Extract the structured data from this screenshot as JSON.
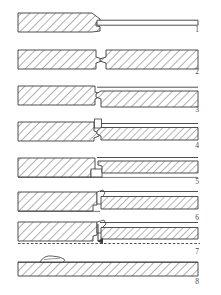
{
  "figure": {
    "background_color": "#ffffff",
    "line_color": "#3b3b3b",
    "hatch_color": "#6e6e6e",
    "label_color": "#4a4a4a",
    "step_count": 8
  },
  "steps": [
    {
      "number": "1",
      "label_x": 197,
      "label_y": 30,
      "caption": "Tapered hatched block at left with thin flat strip extending to the right",
      "parts": [
        {
          "name": "left-block",
          "kind": "hatched-block",
          "x": 18,
          "y": 13,
          "w": 82,
          "h": 19,
          "taper": "right-point"
        },
        {
          "name": "right-strip",
          "kind": "outline-strip",
          "x": 96,
          "y": 20,
          "w": 102,
          "h": 5
        }
      ]
    },
    {
      "number": "2",
      "label_x": 197,
      "label_y": 72,
      "caption": "Two hatched blocks facing each other with mating interlock profile at centre",
      "parts": [
        {
          "name": "left-block",
          "kind": "hatched-block",
          "x": 18,
          "y": 50,
          "w": 82,
          "h": 19,
          "taper": "interlock-male"
        },
        {
          "name": "right-block",
          "kind": "hatched-block",
          "x": 104,
          "y": 50,
          "w": 94,
          "h": 19,
          "taper": "interlock-female"
        }
      ]
    },
    {
      "number": "3",
      "label_x": 197,
      "label_y": 110,
      "caption": "Blocks closer together, right block stepped lower, thin strip above right side",
      "parts": [
        {
          "name": "left-block",
          "kind": "hatched-block",
          "x": 18,
          "y": 86,
          "w": 82,
          "h": 19,
          "taper": "interlock-male"
        },
        {
          "name": "right-block",
          "kind": "hatched-block",
          "x": 100,
          "y": 90,
          "w": 98,
          "h": 17,
          "taper": "interlock-female"
        },
        {
          "name": "upper-strip",
          "kind": "outline-line",
          "x": 100,
          "y": 86,
          "w": 98,
          "h": 1
        }
      ]
    },
    {
      "number": "4",
      "label_x": 197,
      "label_y": 146,
      "caption": "Joint engaged, small vertical flash element at interface, right member thinned",
      "parts": [
        {
          "name": "left-block",
          "kind": "hatched-block",
          "x": 18,
          "y": 122,
          "w": 80,
          "h": 19,
          "taper": "flat"
        },
        {
          "name": "flash-element",
          "kind": "small-detail",
          "x": 94,
          "y": 118,
          "w": 8,
          "h": 10
        },
        {
          "name": "right-block",
          "kind": "hatched-block",
          "x": 99,
          "y": 128,
          "w": 99,
          "h": 13,
          "taper": "wedge"
        }
      ]
    },
    {
      "number": "5",
      "label_x": 197,
      "label_y": 182,
      "caption": "Right member overlapping, stepped shoulder at interface with lower guide line",
      "parts": [
        {
          "name": "left-block",
          "kind": "hatched-block",
          "x": 18,
          "y": 158,
          "w": 78,
          "h": 19,
          "taper": "flat"
        },
        {
          "name": "right-block",
          "kind": "hatched-block",
          "x": 98,
          "y": 160,
          "w": 100,
          "h": 12,
          "taper": "wedge"
        },
        {
          "name": "step-detail",
          "kind": "small-detail",
          "x": 92,
          "y": 168,
          "w": 10,
          "h": 9
        }
      ]
    },
    {
      "number": "6",
      "label_x": 197,
      "label_y": 218,
      "caption": "Interface closing with curved hook profile, right member aligned",
      "parts": [
        {
          "name": "left-block",
          "kind": "hatched-block",
          "x": 18,
          "y": 192,
          "w": 80,
          "h": 19,
          "taper": "flat"
        },
        {
          "name": "hook-detail",
          "kind": "small-detail",
          "x": 96,
          "y": 188,
          "w": 10,
          "h": 10
        },
        {
          "name": "right-block",
          "kind": "hatched-block",
          "x": 100,
          "y": 196,
          "w": 98,
          "h": 13,
          "taper": "wedge"
        }
      ]
    },
    {
      "number": "7",
      "label_x": 197,
      "label_y": 252,
      "caption": "Upsetting force applied, downward arrow at joint, dashed reference datum below",
      "parts": [
        {
          "name": "left-block",
          "kind": "hatched-block",
          "x": 18,
          "y": 222,
          "w": 80,
          "h": 19,
          "taper": "flat"
        },
        {
          "name": "force-arrow",
          "kind": "arrow-down",
          "x": 98,
          "y": 222,
          "w": 1,
          "h": 18
        },
        {
          "name": "right-block",
          "kind": "hatched-block",
          "x": 100,
          "y": 228,
          "w": 98,
          "h": 12,
          "taper": "wedge"
        },
        {
          "name": "datum-line",
          "kind": "dashed-line",
          "x": 18,
          "y": 243,
          "w": 182,
          "h": 1
        }
      ]
    },
    {
      "number": "8",
      "label_x": 197,
      "label_y": 282,
      "caption": "Completed joint: single continuous hatched bar with small upset bead on upper surface",
      "parts": [
        {
          "name": "joined-bar",
          "kind": "hatched-block",
          "x": 18,
          "y": 262,
          "w": 180,
          "h": 14,
          "taper": "flat"
        },
        {
          "name": "weld-bead",
          "kind": "small-detail",
          "x": 40,
          "y": 257,
          "w": 24,
          "h": 6
        }
      ]
    }
  ]
}
